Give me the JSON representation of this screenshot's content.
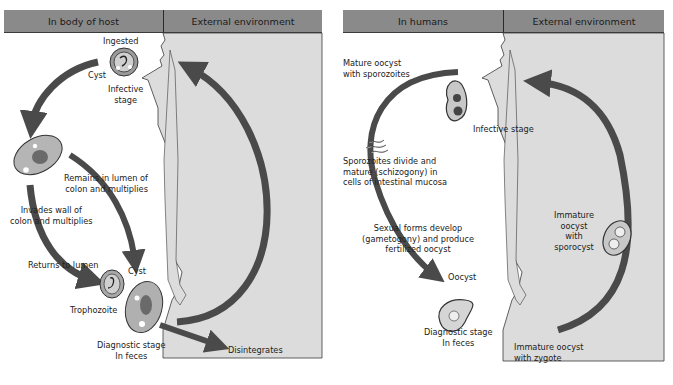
{
  "left": {
    "header_left": "In body of host",
    "header_right": "External environment",
    "labels": {
      "ingested": "Ingested",
      "cyst_top": "Cyst",
      "infective_1": "Infective",
      "infective_2": "stage",
      "remains_1": "Remains in lumen of",
      "remains_2": "colon and multiplies",
      "invades_1": "Invades wall of",
      "invades_2": "colon and multiplies",
      "returns": "Returns to lumen",
      "cyst_bottom": "Cyst",
      "trophozoite": "Trophozoite",
      "diagnostic_1": "Diagnostic stage",
      "diagnostic_2": "In feces",
      "disintegrates": "Disintegrates"
    }
  },
  "right": {
    "header_left": "In humans",
    "header_right": "External environment",
    "labels": {
      "mature_1": "Mature oocyst",
      "mature_2": "with sporozoites",
      "infective": "Infective stage",
      "sporozoites_1": "Sporozoites divide and",
      "sporozoites_2": "mature (schizogony) in",
      "sporozoites_3": "cells of intestinal mucosa",
      "sexual_1": "Sexual forms develop",
      "sexual_2": "(gametogony) and produce",
      "sexual_3": "fertilized oocyst",
      "oocyst": "Oocyst",
      "diagnostic_1": "Diagnostic stage",
      "diagnostic_2": "In feces",
      "immature_spor_1": "Immature",
      "immature_spor_2": "oocyst",
      "immature_spor_3": "with",
      "immature_spor_4": "sporocyst",
      "immature_zyg_1": "Immature oocyst",
      "immature_zyg_2": "with zygote"
    }
  },
  "colors": {
    "header": "#8a8a8a",
    "external_bg": "#dcdcdc",
    "arrow": "#4a4a4a",
    "outline": "#3a3a3a"
  }
}
